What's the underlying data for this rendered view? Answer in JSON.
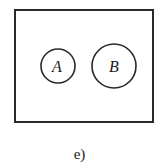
{
  "figure": {
    "caption": "e)",
    "universe": {
      "x": 15,
      "y": 10,
      "width": 138,
      "height": 112,
      "stroke": "#2a2a2a"
    },
    "sets": [
      {
        "label": "A",
        "cx": 58,
        "cy": 66,
        "r": 17
      },
      {
        "label": "B",
        "cx": 114,
        "cy": 66,
        "r": 22
      }
    ],
    "relationship": "disjoint"
  }
}
